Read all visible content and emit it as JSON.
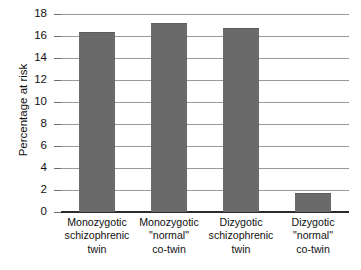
{
  "attribution": "© Cengage Learning®",
  "chart_data": {
    "type": "bar",
    "title": "",
    "xlabel": "",
    "ylabel": "Percentage at risk",
    "ylim": [
      0,
      18
    ],
    "ytick_values": [
      0,
      2,
      4,
      6,
      8,
      10,
      12,
      14,
      16,
      18
    ],
    "ytick_labels": [
      "0",
      "2",
      "4",
      "6",
      "8",
      "10",
      "12",
      "14",
      "16",
      "18"
    ],
    "grid": "horizontal",
    "legend": "none",
    "bar_color": "#6a6a6a",
    "categories": [
      "Monozygotic schizophrenic twin",
      "Monozygotic “normal” co-twin",
      "Dizygotic schizophrenic twin",
      "Dizygotic “normal” co-twin"
    ],
    "category_lines": [
      [
        "Monozygotic",
        "schizophrenic",
        "twin"
      ],
      [
        "Monozygotic",
        "\"normal\"",
        "co-twin"
      ],
      [
        "Dizygotic",
        "schizophrenic",
        "twin"
      ],
      [
        "Dizygotic",
        "\"normal\"",
        "co-twin"
      ]
    ],
    "values": [
      16.4,
      17.2,
      16.7,
      1.7
    ]
  }
}
